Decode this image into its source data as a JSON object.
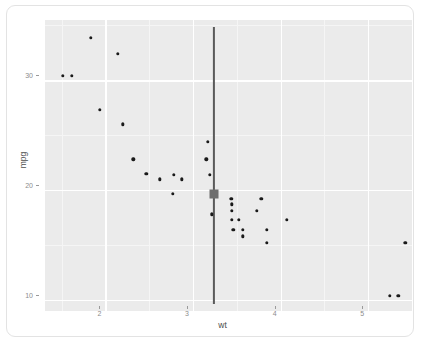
{
  "chart_data": {
    "type": "scatter",
    "title": "",
    "xlabel": "wt",
    "ylabel": "mpg",
    "xlim": [
      1.31,
      5.5
    ],
    "ylim": [
      9.0,
      35.5
    ],
    "xticks": [
      2,
      3,
      4,
      5
    ],
    "xtick_labels": [
      "2",
      "3",
      "4",
      "5"
    ],
    "yticks": [
      10,
      20,
      30
    ],
    "ytick_labels": [
      "10",
      "20",
      "30"
    ],
    "grid": true,
    "grid_major_color": "#ffffff",
    "grid_minor_color": "#f5f5f5",
    "panel_background": "#ebebeb",
    "point_color": "#1a1a1a",
    "legend": "none",
    "points": [
      {
        "x": 1.513,
        "y": 30.4
      },
      {
        "x": 1.615,
        "y": 30.4
      },
      {
        "x": 1.835,
        "y": 33.9
      },
      {
        "x": 1.935,
        "y": 27.3
      },
      {
        "x": 2.14,
        "y": 32.4
      },
      {
        "x": 2.2,
        "y": 26.0
      },
      {
        "x": 2.32,
        "y": 22.8
      },
      {
        "x": 2.465,
        "y": 21.5
      },
      {
        "x": 2.62,
        "y": 21.0
      },
      {
        "x": 2.77,
        "y": 19.7
      },
      {
        "x": 2.78,
        "y": 21.4
      },
      {
        "x": 2.875,
        "y": 21.0
      },
      {
        "x": 3.15,
        "y": 22.8
      },
      {
        "x": 3.17,
        "y": 24.4
      },
      {
        "x": 3.19,
        "y": 21.4
      },
      {
        "x": 3.215,
        "y": 17.8
      },
      {
        "x": 3.435,
        "y": 19.2
      },
      {
        "x": 3.44,
        "y": 18.7
      },
      {
        "x": 3.44,
        "y": 18.1
      },
      {
        "x": 3.44,
        "y": 17.3
      },
      {
        "x": 3.46,
        "y": 16.4
      },
      {
        "x": 3.52,
        "y": 17.3
      },
      {
        "x": 3.57,
        "y": 16.4
      },
      {
        "x": 3.57,
        "y": 15.8
      },
      {
        "x": 3.73,
        "y": 18.1
      },
      {
        "x": 3.78,
        "y": 19.2
      },
      {
        "x": 3.845,
        "y": 16.4
      },
      {
        "x": 3.845,
        "y": 15.2
      },
      {
        "x": 4.07,
        "y": 17.3
      },
      {
        "x": 5.25,
        "y": 10.4
      },
      {
        "x": 5.345,
        "y": 10.4
      },
      {
        "x": 5.424,
        "y": 15.2
      }
    ],
    "vertical_reference_line": {
      "x": 3.24,
      "color": "#5a5a5a",
      "y_start": 34.9,
      "y_end": 9.6
    },
    "highlighted_point": {
      "x": 3.24,
      "y": 19.7,
      "marker": "square",
      "color": "#6e6e6e"
    }
  }
}
